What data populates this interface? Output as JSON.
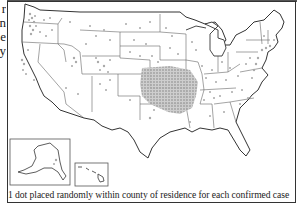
{
  "figure": {
    "type": "dot density map",
    "region": "United States",
    "caption": "1 dot placed randomly within county of residence for each confirmed case",
    "side_text_fragments": [
      "r",
      "n",
      "e",
      "y"
    ],
    "insets": [
      {
        "name": "Alaska"
      },
      {
        "name": "Hawaii"
      }
    ],
    "colors": {
      "dots": "#a9a9a9",
      "borders": "#333333",
      "state_lines": "#555555",
      "background": "#ffffff"
    },
    "dot_concentrations": [
      "Kansas / Missouri / Oklahoma / Arkansas (densest)",
      "Western Washington / Oregon",
      "Northern California coast",
      "Colorado / Utah / Wyoming",
      "Dakotas / Nebraska",
      "Upper Midwest and Ohio Valley",
      "Northeast corridor (MA, NY, NJ, MD)"
    ]
  }
}
